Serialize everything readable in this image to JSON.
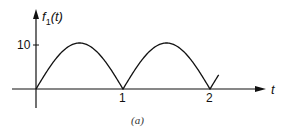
{
  "chart_data": {
    "type": "line",
    "title": "",
    "caption": "(a)",
    "xlabel": "t",
    "ylabel": "f₁(t)",
    "ylabel_parts": {
      "name": "f",
      "sub": "1",
      "arg": "(t)"
    },
    "x_ticks": [
      1,
      2
    ],
    "x_tick_labels": [
      "1",
      "2"
    ],
    "y_ticks": [
      10
    ],
    "y_tick_labels": [
      "10"
    ],
    "xlim": [
      -0.3,
      2.8
    ],
    "ylim": [
      -3,
      17
    ],
    "grid": false,
    "legend": null,
    "function": "f1(t) = |10 sin(π t)|",
    "series": [
      {
        "name": "f1(t)",
        "x": [
          0,
          0.1,
          0.2,
          0.3,
          0.4,
          0.5,
          0.6,
          0.7,
          0.8,
          0.9,
          1.0,
          1.1,
          1.2,
          1.3,
          1.4,
          1.5,
          1.6,
          1.7,
          1.8,
          1.9,
          2.0,
          2.1
        ],
        "values": [
          0,
          3.09,
          5.88,
          8.09,
          9.51,
          10,
          9.51,
          8.09,
          5.88,
          3.09,
          0,
          3.09,
          5.88,
          8.09,
          9.51,
          10,
          9.51,
          8.09,
          5.88,
          3.09,
          0,
          3.09
        ]
      }
    ]
  }
}
